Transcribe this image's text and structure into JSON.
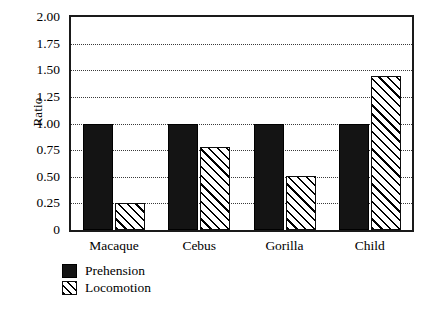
{
  "chart_data": {
    "type": "bar",
    "title": "",
    "xlabel": "",
    "ylabel": "Ratio",
    "categories": [
      "Macaque",
      "Cebus",
      "Gorilla",
      "Child"
    ],
    "series": [
      {
        "name": "Prehension",
        "values": [
          1.0,
          1.0,
          1.0,
          1.0
        ],
        "fill": "solid-black"
      },
      {
        "name": "Locomotion",
        "values": [
          0.25,
          0.78,
          0.51,
          1.45
        ],
        "fill": "diagonal-hatch"
      }
    ],
    "ylim": [
      0,
      2.0
    ],
    "ytick_values": [
      0,
      0.25,
      0.5,
      0.75,
      1.0,
      1.25,
      1.5,
      1.75,
      2.0
    ],
    "ytick_labels": [
      "0",
      "0.25",
      "0.50",
      "0.75",
      "1.00",
      "1.25",
      "1.50",
      "1.75",
      "2.00"
    ],
    "grid": true,
    "grid_style": "dotted-horizontal",
    "legend_position": "below-left",
    "legend_entries": [
      "Prehension",
      "Locomotion"
    ],
    "colors": {
      "prehension": "#141414",
      "locomotion_outline": "#0d0d0d",
      "locomotion_fill": "#ffffff",
      "axis": "#1a1a1a",
      "grid": "#3a3a3a",
      "background": "#ffffff"
    }
  }
}
